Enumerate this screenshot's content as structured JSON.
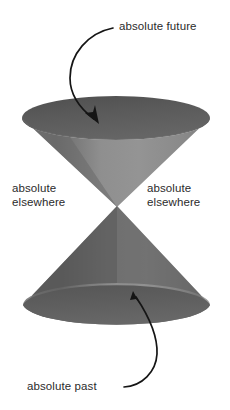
{
  "figure": {
    "background_color": "#ffffff",
    "text_color": "#2b2b2b",
    "stroke_color": "#151515"
  },
  "labels": {
    "future": "absolute future",
    "past": "absolute past",
    "elsewhere_left_line1": "absolute",
    "elsewhere_left_line2": "elsewhere",
    "elsewhere_right_line1": "absolute",
    "elsewhere_right_line2": "elsewhere"
  },
  "diagram_data": {
    "type": "light-cone",
    "vertex": {
      "x": 117,
      "y": 206
    },
    "upper_cone": {
      "name": "absolute future",
      "rim_ellipse": {
        "cx": 116,
        "cy": 118,
        "rx": 94,
        "ry": 22
      },
      "inner_surface_color": "#595959",
      "outer_surface_color_light": "#8d8d8d",
      "outer_surface_color_dark": "#6d6d6d"
    },
    "lower_cone": {
      "name": "absolute past",
      "rim_ellipse": {
        "cx": 116,
        "cy": 305,
        "rx": 94,
        "ry": 22
      },
      "base_surface_color": "#5c5c5c",
      "outer_surface_color_light": "#8d8d8d",
      "outer_surface_color_dark": "#5f5f5f"
    },
    "elsewhere_regions": [
      "left",
      "right"
    ],
    "annotations": [
      {
        "label": "absolute future",
        "arrow_from": {
          "x": 112,
          "y": 28
        },
        "arrow_to": {
          "x": 97,
          "y": 122
        }
      },
      {
        "label": "absolute past",
        "arrow_from": {
          "x": 129,
          "y": 387
        },
        "arrow_to": {
          "x": 134,
          "y": 292
        }
      }
    ]
  }
}
